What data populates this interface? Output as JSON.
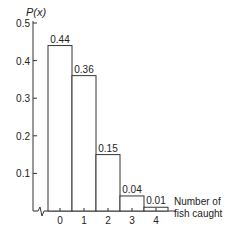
{
  "chart_data": {
    "type": "bar",
    "title": "",
    "ylabel": "P(x)",
    "xlabel": "Number of fish caught",
    "xlabel_lines": [
      "Number of",
      "fish caught"
    ],
    "categories": [
      "0",
      "1",
      "2",
      "3",
      "4"
    ],
    "values": [
      0.44,
      0.36,
      0.15,
      0.04,
      0.01
    ],
    "value_labels": [
      "0.44",
      "0.36",
      "0.15",
      "0.04",
      "0.01"
    ],
    "yticks": [
      "0.1",
      "0.2",
      "0.3",
      "0.4",
      "0.5"
    ],
    "ylim": [
      0,
      0.5
    ],
    "grid": false,
    "legend": null,
    "axis_break": true
  }
}
